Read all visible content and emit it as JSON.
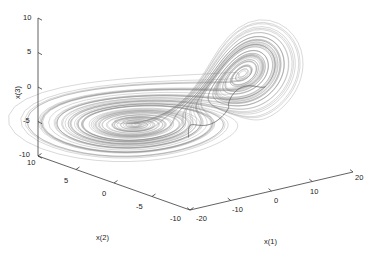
{
  "figure": {
    "background_color": "#ffffff",
    "axis_color": "#262626",
    "data_color": "#7a7a7a",
    "spine_color": "#555555"
  },
  "chart_data": {
    "type": "line",
    "title": "",
    "subtitle": "",
    "projection": "3d",
    "grid": false,
    "legend": null,
    "xlabel": "x(1)",
    "ylabel": "x(2)",
    "zlabel": "x(3)",
    "xlim": [
      -20,
      20
    ],
    "ylim": [
      -10,
      10
    ],
    "zlim": [
      -10,
      10
    ],
    "xticks": [
      -20,
      -10,
      0,
      10,
      20
    ],
    "yticks": [
      10,
      5,
      0,
      -5,
      -10
    ],
    "zticks": [
      -10,
      -5,
      0,
      5,
      10
    ],
    "xtick_labels": [
      "-20",
      "-10",
      "0",
      "10",
      "20"
    ],
    "ytick_labels": [
      "10",
      "5",
      "0",
      "-5",
      "-10"
    ],
    "ztick_labels": [
      "-10",
      "-5",
      "0",
      "5",
      "10"
    ],
    "series": [
      {
        "name": "trajectory",
        "color": "#7a7a7a",
        "linewidth": 0.4,
        "n_points": 2200
      }
    ]
  },
  "axes": {
    "z_axis": {
      "label": "x(3)",
      "ticks": [
        {
          "value": 10,
          "label": "10"
        },
        {
          "value": 5,
          "label": "5"
        },
        {
          "value": 0,
          "label": "0"
        },
        {
          "value": -5,
          "label": "-5"
        },
        {
          "value": -10,
          "label": "-10"
        }
      ]
    },
    "y_axis": {
      "label": "x(2)",
      "ticks": [
        {
          "value": 10,
          "label": "10"
        },
        {
          "value": 5,
          "label": "5"
        },
        {
          "value": 0,
          "label": "0"
        },
        {
          "value": -5,
          "label": "-5"
        },
        {
          "value": -10,
          "label": "-10"
        }
      ]
    },
    "x_axis": {
      "label": "x(1)",
      "ticks": [
        {
          "value": -20,
          "label": "-20"
        },
        {
          "value": -10,
          "label": "-10"
        },
        {
          "value": 0,
          "label": "0"
        },
        {
          "value": 10,
          "label": "10"
        },
        {
          "value": 20,
          "label": "20"
        }
      ]
    }
  },
  "tick_labels": {
    "z": [
      "10",
      "5",
      "0",
      "-5",
      "-10"
    ],
    "y": [
      "10",
      "5",
      "0",
      "-5",
      "-10"
    ],
    "x": [
      "-20",
      "-10",
      "0",
      "10",
      "20"
    ]
  }
}
